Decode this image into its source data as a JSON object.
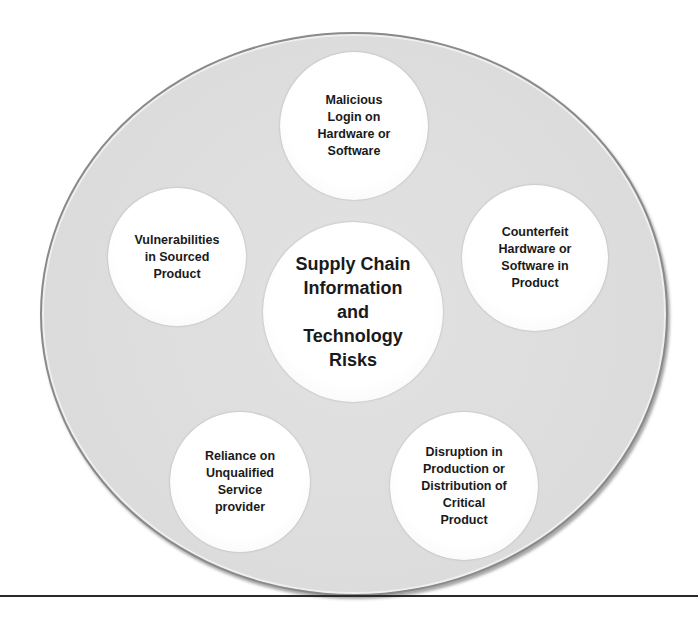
{
  "diagram": {
    "type": "radial-cluster",
    "colors": {
      "outer_fill": "#dcdcdc",
      "outer_border": "#8a8a8a",
      "node_fill": "#ffffff",
      "text": "#1a1a1a",
      "rule": "#2a2a2a"
    },
    "center": {
      "label": "Supply Chain\nInformation\nand\nTechnology\nRisks"
    },
    "nodes": [
      {
        "position": "top",
        "label": "Malicious\nLogin on\nHardware or\nSoftware"
      },
      {
        "position": "upper-left",
        "label": "Vulnerabilities\nin Sourced\nProduct"
      },
      {
        "position": "upper-right",
        "label": "Counterfeit\nHardware or\nSoftware in\nProduct"
      },
      {
        "position": "lower-left",
        "label": "Reliance on\nUnqualified\nService\nprovider"
      },
      {
        "position": "lower-right",
        "label": "Disruption in\nProduction or\nDistribution of\nCritical\nProduct"
      }
    ]
  }
}
